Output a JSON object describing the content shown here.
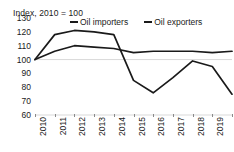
{
  "chart_data": {
    "type": "line",
    "title": "Index, 2010 = 100",
    "xlabel": "",
    "ylabel": "",
    "ylim": [
      60,
      130
    ],
    "yticks": [
      130,
      120,
      110,
      100,
      90,
      80,
      70,
      60
    ],
    "grid": "single gridline at 100",
    "legend_position": "top",
    "categories": [
      "2010",
      "2011",
      "2012",
      "2013",
      "2014",
      "2015",
      "2016",
      "2017",
      "2018",
      "2019",
      "2020"
    ],
    "series": [
      {
        "name": "Oil importers",
        "color": "#1a1a1a",
        "values": [
          100,
          106,
          110,
          109,
          108,
          105,
          106,
          106,
          106,
          105,
          106
        ]
      },
      {
        "name": "Oil exporters",
        "color": "#1a1a1a",
        "values": [
          100,
          118,
          121,
          120,
          118,
          85,
          76,
          87,
          99,
          95,
          75
        ]
      }
    ]
  },
  "axis": {
    "y_labels": [
      "130",
      "120",
      "110",
      "100",
      "90",
      "80",
      "70",
      "60"
    ],
    "x_labels": [
      "2010",
      "2011",
      "2012",
      "2013",
      "2014",
      "2015",
      "2016",
      "2017",
      "2018",
      "2019",
      "2020"
    ]
  },
  "legend": {
    "items": [
      {
        "label": "Oil importers"
      },
      {
        "label": "Oil exporters"
      }
    ]
  },
  "colors": {
    "line": "#1a1a1a",
    "gridline": "#d9d9d9",
    "tick": "#8a8a8a",
    "text": "#1a1a1a",
    "background": "#ffffff"
  }
}
